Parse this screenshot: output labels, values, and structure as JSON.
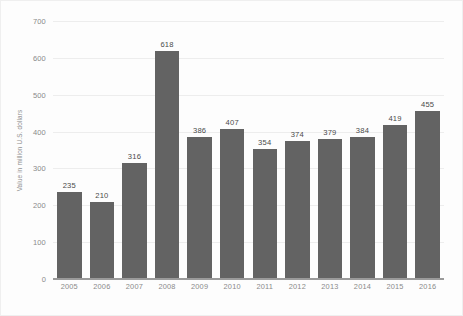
{
  "chart_data": {
    "type": "bar",
    "title": "",
    "subtitle": "",
    "xlabel": "",
    "ylabel": "Value in million U.S. dollars",
    "categories": [
      "2005",
      "2006",
      "2007",
      "2008",
      "2009",
      "2010",
      "2011",
      "2012",
      "2013",
      "2014",
      "2015",
      "2016"
    ],
    "values": [
      235,
      210,
      316,
      618,
      386,
      407,
      354,
      374,
      379,
      384,
      419,
      455
    ],
    "ylim": [
      0,
      700
    ],
    "yticks": [
      0,
      100,
      200,
      300,
      400,
      500,
      600,
      700
    ],
    "ytick_labels": [
      "0",
      "100",
      "200",
      "300",
      "400",
      "500",
      "600",
      "700"
    ],
    "grid": true,
    "legend": false,
    "data_labels": [
      "235",
      "210",
      "316",
      "618",
      "386",
      "407",
      "354",
      "374",
      "379",
      "384",
      "419",
      "455"
    ],
    "bar_color": "#636363",
    "grid_color": "#ededed",
    "axis_color": "#9a9a9a",
    "text_color": "#8a8a8a",
    "background_color": "#fdfdfd"
  }
}
